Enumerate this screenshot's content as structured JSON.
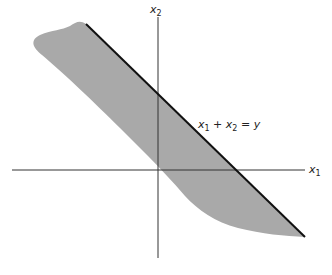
{
  "diagram": {
    "type": "geometric-region",
    "axes": {
      "horizontal": {
        "label": "x",
        "subscript": "1"
      },
      "vertical": {
        "label": "x",
        "subscript": "2"
      }
    },
    "line_label": {
      "parts": [
        "x",
        "1",
        " + x",
        "2",
        " = y"
      ]
    },
    "colors": {
      "region_fill": "#a9a9a9",
      "line": "#111111",
      "axis": "#333333",
      "background": "#ffffff"
    }
  }
}
